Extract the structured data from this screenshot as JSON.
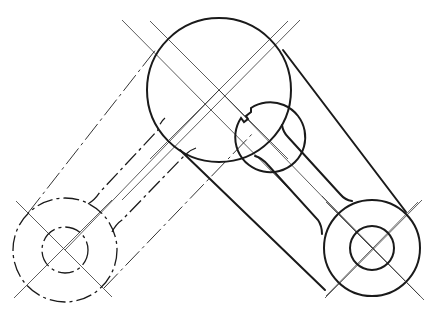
{
  "drawing": {
    "title": "Linkage mechanism technical drawing",
    "colors": {
      "line": "#1a1a1a",
      "center_line": "#333333",
      "background": "#ffffff"
    },
    "parts": [
      {
        "name": "central-hub",
        "center": [
          219,
          90
        ],
        "outer_radius": 72,
        "bore_radius": 35,
        "keyway": true,
        "style": "solid"
      },
      {
        "name": "left-eye",
        "center": [
          65,
          250
        ],
        "outer_radius": 52,
        "bore_radius": 23,
        "style": "phantom"
      },
      {
        "name": "right-eye",
        "center": [
          372,
          248
        ],
        "outer_radius": 48,
        "bore_radius": 22,
        "style": "solid"
      }
    ],
    "arms": [
      {
        "name": "left-arm",
        "from": "central-hub",
        "to": "left-eye",
        "style": "phantom"
      },
      {
        "name": "right-arm",
        "from": "central-hub",
        "to": "right-eye",
        "style": "solid"
      }
    ]
  }
}
